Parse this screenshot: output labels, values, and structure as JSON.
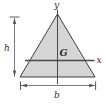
{
  "diagram": {
    "type": "geometry-figure",
    "labels": {
      "y_axis": "y",
      "x_axis": "x",
      "centroid": "G",
      "height_dim": "h",
      "base_dim": "b"
    },
    "colors": {
      "triangle_fill": "#d6d6d6",
      "triangle_outline": "#3f3f3f",
      "axis_line": "#4a4a4a",
      "dimension_line": "#5a5a5a",
      "label_text": "#2e2e2e",
      "background": "#ffffff"
    }
  }
}
